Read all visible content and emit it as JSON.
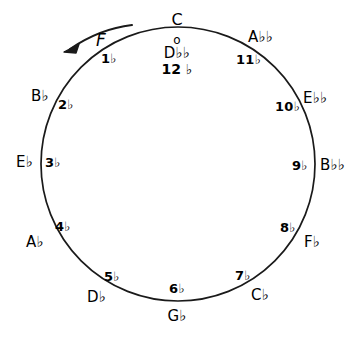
{
  "figure": {
    "background_color": "#ffffff",
    "ink_color": "#000000"
  },
  "circle": {
    "center_x": 178,
    "center_y": 164,
    "radius": 137
  },
  "arrow": {
    "label": "F",
    "direction": "counterclockwise",
    "icon": "curved-arrow-icon"
  },
  "top": {
    "tonic": "C",
    "zero_marker": "o",
    "enharmonic": "D♭♭",
    "enharmonic_count": "12 ♭"
  },
  "chart_data": {
    "type": "scatter",
    "xlabel": "",
    "ylabel": "",
    "center": [
      178,
      164
    ],
    "radius": 137,
    "direction": "counterclockwise",
    "grid": false,
    "legend": false,
    "points": [
      {
        "note": "C",
        "count": "o",
        "flats": 0,
        "angle_deg": 90,
        "note_x": 178,
        "note_y": 20,
        "count_x": 178,
        "count_y": 40,
        "note_anchor": "center",
        "count_anchor": "center"
      },
      {
        "note": "D♭♭",
        "count": "12 ♭",
        "flats": 12,
        "angle_deg": 90,
        "note_x": 178,
        "note_y": 53,
        "count_x": 178,
        "count_y": 68,
        "note_anchor": "center",
        "count_anchor": "center"
      },
      {
        "note": "F",
        "count": "1♭",
        "flats": 1,
        "angle_deg": 120,
        "note_x": 104,
        "note_y": 41,
        "count_x": 110,
        "count_y": 60,
        "note_anchor": "center",
        "count_anchor": "center"
      },
      {
        "note": "B♭",
        "count": "2♭",
        "flats": 2,
        "angle_deg": 150,
        "note_x": 42,
        "note_y": 97,
        "count_x": 68,
        "count_y": 105,
        "note_anchor": "center",
        "count_anchor": "center"
      },
      {
        "note": "E♭",
        "count": "3♭",
        "flats": 3,
        "angle_deg": 180,
        "note_x": 27,
        "note_y": 163,
        "count_x": 54,
        "count_y": 162,
        "note_anchor": "center",
        "count_anchor": "center"
      },
      {
        "note": "A♭",
        "count": "4♭",
        "flats": 4,
        "angle_deg": 210,
        "note_x": 37,
        "note_y": 243,
        "count_x": 64,
        "count_y": 227,
        "note_anchor": "center",
        "count_anchor": "center"
      },
      {
        "note": "D♭",
        "count": "5♭",
        "flats": 5,
        "angle_deg": 240,
        "note_x": 98,
        "note_y": 298,
        "count_x": 113,
        "count_y": 277,
        "note_anchor": "center",
        "count_anchor": "center"
      },
      {
        "note": "G♭",
        "count": "6♭",
        "flats": 6,
        "angle_deg": 270,
        "note_x": 178,
        "note_y": 317,
        "count_x": 178,
        "count_y": 289,
        "note_anchor": "center",
        "count_anchor": "center"
      },
      {
        "note": "C♭",
        "count": "7♭",
        "flats": 7,
        "angle_deg": 300,
        "note_x": 262,
        "note_y": 296,
        "count_x": 243,
        "count_y": 276,
        "note_anchor": "center",
        "count_anchor": "center"
      },
      {
        "note": "F♭",
        "count": "8♭",
        "flats": 8,
        "angle_deg": 330,
        "note_x": 314,
        "note_y": 243,
        "count_x": 288,
        "count_y": 228,
        "note_anchor": "center",
        "count_anchor": "center"
      },
      {
        "note": "B♭♭",
        "count": "9♭",
        "flats": 9,
        "angle_deg": 0,
        "note_x": 334,
        "note_y": 166,
        "count_x": 300,
        "count_y": 165,
        "note_anchor": "center",
        "count_anchor": "center"
      },
      {
        "note": "E♭♭",
        "count": "10♭",
        "flats": 10,
        "angle_deg": 30,
        "note_x": 317,
        "note_y": 99,
        "count_x": 288,
        "count_y": 106,
        "note_anchor": "center",
        "count_anchor": "center"
      },
      {
        "note": "A♭♭",
        "count": "11♭",
        "flats": 11,
        "angle_deg": 60,
        "note_x": 262,
        "note_y": 38,
        "count_x": 248,
        "count_y": 60,
        "note_anchor": "center",
        "count_anchor": "center"
      }
    ]
  }
}
